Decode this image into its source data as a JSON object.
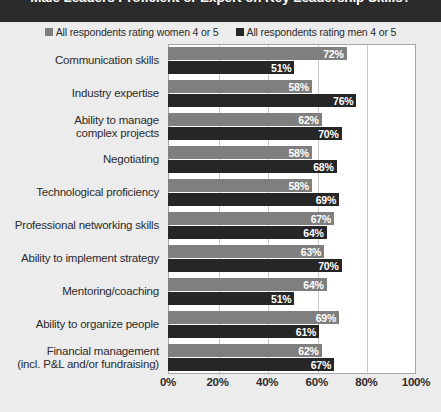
{
  "title": "Male Leaders Proficient or Expert on Key Leadership Skills?",
  "legend": {
    "items": [
      {
        "label": "All respondents rating women 4 or 5",
        "color": "#7f7f7f",
        "icon": "legend-square-icon"
      },
      {
        "label": "All respondents rating men 4 or 5",
        "color": "#262626",
        "icon": "legend-square-icon"
      }
    ]
  },
  "colors": {
    "women_bar": "#7f7f7f",
    "men_bar": "#262626",
    "header_band": "#2b2b2b",
    "page_background": "#ececed",
    "plot_background": "#ffffff",
    "gridline": "#c9c9c9"
  },
  "xaxis": {
    "ticks": [
      "0%",
      "20%",
      "40%",
      "60%",
      "80%",
      "100%"
    ],
    "values": [
      0,
      20,
      40,
      60,
      80,
      100
    ]
  },
  "chart_data": {
    "type": "bar",
    "orientation": "horizontal",
    "title": "Male Leaders Proficient or Expert on Key Leadership Skills?",
    "xlabel": "",
    "ylabel": "",
    "xlim": [
      0,
      100
    ],
    "grid": true,
    "legend_position": "top-center",
    "categories": [
      "Communication skills",
      "Industry expertise",
      "Ability to manage complex projects",
      "Negotiating",
      "Technological proficiency",
      "Professional networking skills",
      "Ability to implement strategy",
      "Mentoring/coaching",
      "Ability to organize people",
      "Financial management (incl. P&L and/or fundraising)"
    ],
    "category_lines": [
      [
        "Communication skills"
      ],
      [
        "Industry expertise"
      ],
      [
        "Ability to manage",
        "complex projects"
      ],
      [
        "Negotiating"
      ],
      [
        "Technological proficiency"
      ],
      [
        "Professional networking skills"
      ],
      [
        "Ability to implement strategy"
      ],
      [
        "Mentoring/coaching"
      ],
      [
        "Ability to organize people"
      ],
      [
        "Financial management",
        "(incl. P&L and/or fundraising)"
      ]
    ],
    "series": [
      {
        "name": "All respondents rating women 4 or 5",
        "color": "#7f7f7f",
        "values": [
          72,
          58,
          62,
          58,
          58,
          67,
          63,
          64,
          69,
          62
        ],
        "labels": [
          "72%",
          "58%",
          "62%",
          "58%",
          "58%",
          "67%",
          "63%",
          "64%",
          "69%",
          "62%"
        ]
      },
      {
        "name": "All respondents rating men 4 or 5",
        "color": "#262626",
        "values": [
          51,
          76,
          70,
          68,
          69,
          64,
          70,
          51,
          61,
          67
        ],
        "labels": [
          "51%",
          "76%",
          "70%",
          "68%",
          "69%",
          "64%",
          "70%",
          "51%",
          "61%",
          "67%"
        ]
      }
    ]
  }
}
